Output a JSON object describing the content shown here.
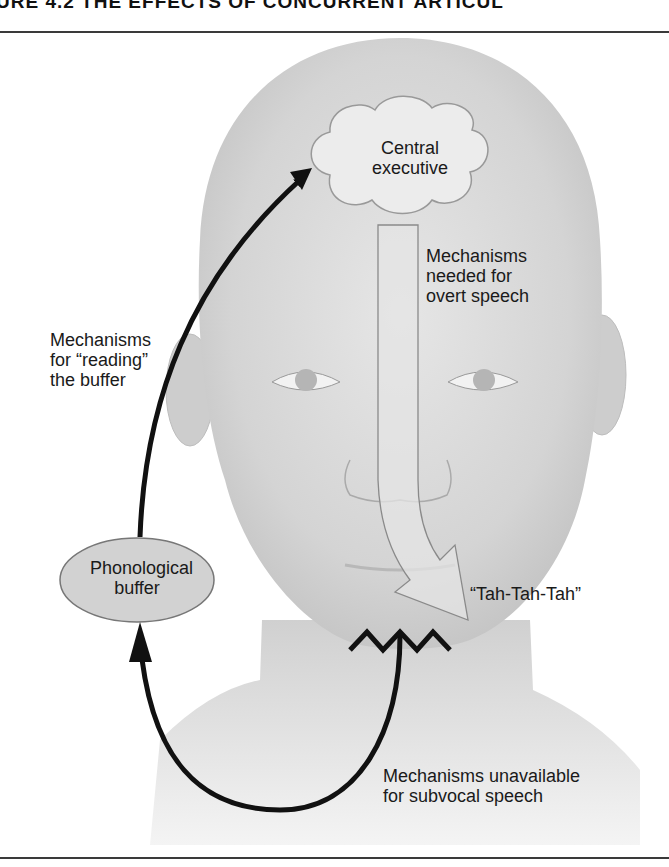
{
  "figure": {
    "title": "URE 4.2   THE EFFECTS OF CONCURRENT ARTICUL"
  },
  "nodes": {
    "central_executive": {
      "lines": [
        "Central",
        "executive"
      ]
    },
    "phonological_buffer": {
      "lines": [
        "Phonological",
        "buffer"
      ]
    }
  },
  "labels": {
    "overt_speech": {
      "lines": [
        "Mechanisms",
        "needed for",
        "overt speech"
      ]
    },
    "reading_buffer": {
      "lines": [
        "Mechanisms",
        "for “reading”",
        "the buffer"
      ]
    },
    "speech_output": "“Tah-Tah-Tah”",
    "subvocal_speech": {
      "lines": [
        "Mechanisms unavailable",
        "for subvocal speech"
      ]
    }
  },
  "colors": {
    "head_skin": "#d6d6d6",
    "cloud_fill": "#ececec",
    "buffer_fill": "#d2d2d2",
    "arrow": "#111111",
    "wide_arrow_fill": "#e4e4e4",
    "wide_arrow_stroke": "#8a8a8a"
  }
}
